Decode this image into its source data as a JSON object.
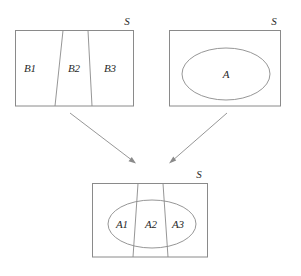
{
  "figure": {
    "stroke_color": "#8a8a8a",
    "text_color": "#2a2a2a",
    "background": "#ffffff"
  },
  "top_left_panel": {
    "name": "partition-panel",
    "universe_label": "S",
    "regions": [
      {
        "label": "B1"
      },
      {
        "label": "B2"
      },
      {
        "label": "B3"
      }
    ]
  },
  "top_right_panel": {
    "name": "event-panel",
    "universe_label": "S",
    "regions": [
      {
        "label": "A"
      }
    ]
  },
  "bottom_panel": {
    "name": "intersection-panel",
    "universe_label": "S",
    "regions": [
      {
        "label": "A1"
      },
      {
        "label": "A2"
      },
      {
        "label": "A3"
      }
    ]
  },
  "arrows": [
    {
      "name": "arrow-from-partition",
      "from": "top_left_panel",
      "to": "bottom_panel"
    },
    {
      "name": "arrow-from-event",
      "from": "top_right_panel",
      "to": "bottom_panel"
    }
  ]
}
